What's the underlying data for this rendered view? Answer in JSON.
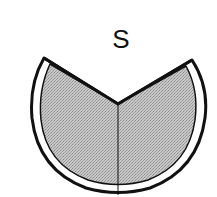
{
  "diagram": {
    "label": "S",
    "shape": "circular-sector-with-v-notch",
    "fill_pattern": "stippled-gray",
    "colors": {
      "fill": "#bdbdbd",
      "stroke": "#111111",
      "background": "#ffffff"
    }
  }
}
